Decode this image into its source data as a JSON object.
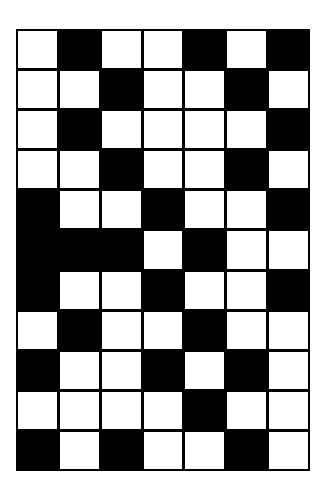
{
  "grid": {
    "columns": 7,
    "rows": 11,
    "colors": {
      "filled": "#000000",
      "empty": "#ffffff",
      "border": "#000000"
    },
    "cells": [
      [
        0,
        1,
        0,
        0,
        1,
        0,
        1
      ],
      [
        0,
        0,
        1,
        0,
        0,
        1,
        0
      ],
      [
        0,
        1,
        0,
        0,
        0,
        0,
        1
      ],
      [
        0,
        0,
        1,
        0,
        0,
        1,
        0
      ],
      [
        1,
        0,
        0,
        1,
        0,
        0,
        1
      ],
      [
        1,
        1,
        1,
        0,
        1,
        0,
        0
      ],
      [
        1,
        0,
        0,
        1,
        0,
        0,
        1
      ],
      [
        0,
        1,
        0,
        0,
        1,
        0,
        0
      ],
      [
        1,
        0,
        0,
        1,
        0,
        1,
        0
      ],
      [
        0,
        0,
        0,
        0,
        1,
        0,
        0
      ],
      [
        1,
        0,
        1,
        0,
        0,
        1,
        0
      ]
    ]
  }
}
